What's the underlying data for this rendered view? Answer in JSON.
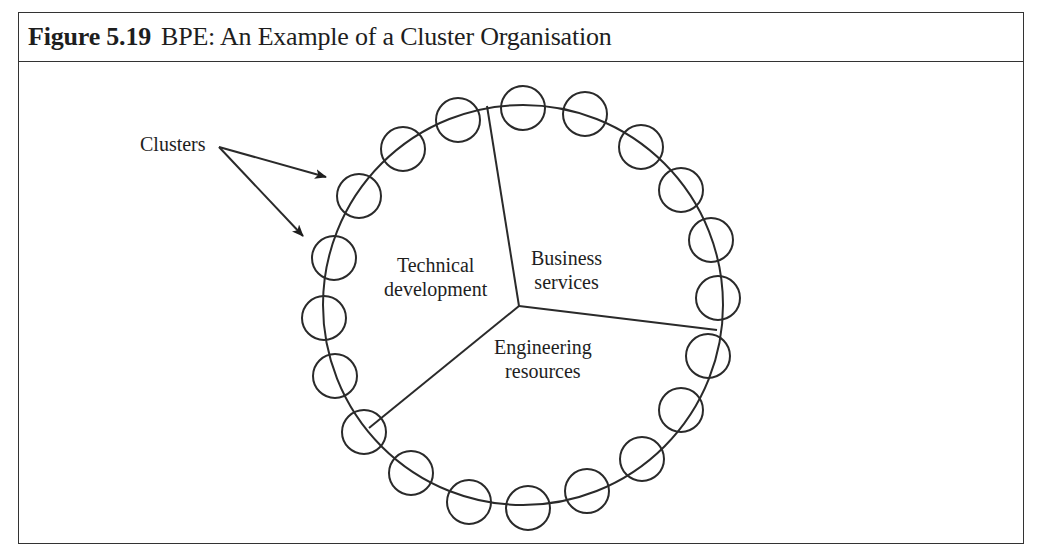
{
  "figure": {
    "number": "Figure 5.19",
    "title": "BPE: An Example of a Cluster Organisation"
  },
  "diagram": {
    "callout_label": "Clusters",
    "segments": [
      {
        "name": "technical-development",
        "line1": "Technical",
        "line2": "development"
      },
      {
        "name": "business-services",
        "line1": "Business",
        "line2": "services"
      },
      {
        "name": "engineering-resources",
        "line1": "Engineering",
        "line2": "resources"
      }
    ],
    "ring": {
      "cx": 523,
      "cy": 305,
      "r": 200
    },
    "hub": {
      "x": 519,
      "y": 306
    },
    "spokes": [
      {
        "x": 487,
        "y": 106
      },
      {
        "x": 717,
        "y": 330
      },
      {
        "x": 369,
        "y": 428
      }
    ],
    "cluster_count": 20,
    "line_color": "#2a2a2a"
  }
}
